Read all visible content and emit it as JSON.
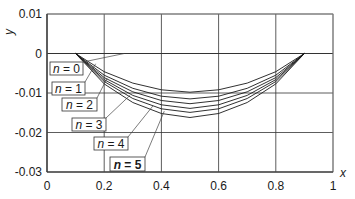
{
  "chart_data": {
    "type": "line",
    "title": "",
    "xlabel": "x",
    "ylabel": "y",
    "xlim": [
      0,
      1
    ],
    "ylim": [
      -0.03,
      0.01
    ],
    "xticks": [
      "0",
      "0.2",
      "0.4",
      "0.6",
      "0.8",
      "1"
    ],
    "yticks": [
      "0.01",
      "0",
      "-0.01",
      "-0.02",
      "-0.03"
    ],
    "grid": true,
    "x": [
      0.1,
      0.2,
      0.3,
      0.4,
      0.5,
      0.6,
      0.7,
      0.8,
      0.9
    ],
    "series": [
      {
        "name": "n = 0",
        "values": [
          0,
          -0.0046,
          -0.0075,
          -0.0092,
          -0.0098,
          -0.0092,
          -0.0075,
          -0.0046,
          0
        ]
      },
      {
        "name": "n = 1",
        "values": [
          0,
          -0.0055,
          -0.0088,
          -0.0108,
          -0.0115,
          -0.0108,
          -0.0088,
          -0.0055,
          0
        ]
      },
      {
        "name": "n = 2",
        "values": [
          0,
          -0.0061,
          -0.0097,
          -0.0119,
          -0.0127,
          -0.0119,
          -0.0097,
          -0.0061,
          0
        ]
      },
      {
        "name": "n = 3",
        "values": [
          0,
          -0.0066,
          -0.0106,
          -0.013,
          -0.0139,
          -0.013,
          -0.0106,
          -0.0066,
          0
        ]
      },
      {
        "name": "n = 4",
        "values": [
          0,
          -0.0071,
          -0.0114,
          -0.014,
          -0.0149,
          -0.014,
          -0.0114,
          -0.0071,
          0
        ]
      },
      {
        "name": "n = 5",
        "values": [
          0,
          -0.0077,
          -0.0124,
          -0.0152,
          -0.0162,
          -0.0152,
          -0.0124,
          -0.0077,
          0
        ]
      }
    ],
    "annotations": [
      {
        "text_var": "n",
        "text_rest": " = 0",
        "bold": false
      },
      {
        "text_var": "n",
        "text_rest": " = 1",
        "bold": false
      },
      {
        "text_var": "n",
        "text_rest": " = 2",
        "bold": false
      },
      {
        "text_var": "n",
        "text_rest": " = 3",
        "bold": false
      },
      {
        "text_var": "n",
        "text_rest": " = 4",
        "bold": false
      },
      {
        "text_var": "n",
        "text_rest": " = 5",
        "bold": true
      }
    ],
    "colors": {
      "lines": "#1a1a1a",
      "grid": "#333333",
      "axes": "#333333",
      "background": "#ffffff"
    }
  }
}
